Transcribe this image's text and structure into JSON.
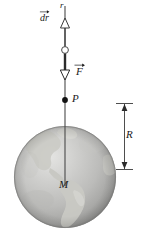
{
  "figure": {
    "labels": {
      "r": "r",
      "dr_base": "dr",
      "force": "F",
      "point": "P",
      "center_mass": "M",
      "radius": "R"
    },
    "colors": {
      "line": "#3a3a3a",
      "text": "#1a1a1a",
      "sphere_light": "#dcdcdc",
      "sphere_mid": "#b4b4b4",
      "sphere_dark": "#8d8d8d",
      "land": "#c9c9c4",
      "background": "#ffffff"
    },
    "geometry": {
      "axis_x": 65,
      "axis_top_y": 6,
      "axis_bottom_y": 186,
      "dr_arrow_tip_y": 19,
      "ring_y": 50,
      "force_arrow_tip_y": 79,
      "point_p_y": 100,
      "sphere_center_x": 65,
      "sphere_center_y": 177,
      "sphere_radius": 51,
      "r_measure_x": 124,
      "r_measure_top_y": 103,
      "r_measure_bottom_y": 170
    }
  }
}
